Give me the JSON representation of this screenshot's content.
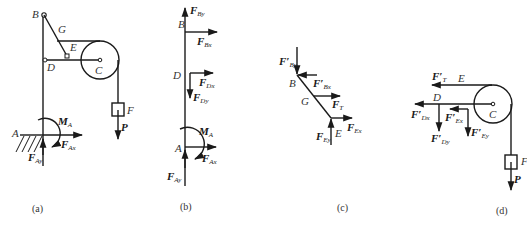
{
  "figure": {
    "colors": {
      "stroke": "#1a1a1a",
      "label": "#333333",
      "background": "#ffffff"
    },
    "panels": [
      {
        "id": "a",
        "caption": "(a)",
        "points": {
          "A": "A",
          "B": "B",
          "C": "C",
          "D": "D",
          "E": "E",
          "F": "F",
          "G": "G"
        },
        "forces": {
          "MA": {
            "main": "M",
            "sub": "A"
          },
          "FAx": {
            "main": "F",
            "sub": "Ax"
          },
          "FAy": {
            "main": "F",
            "sub": "Ay"
          },
          "P": {
            "main": "P",
            "sub": ""
          }
        }
      },
      {
        "id": "b",
        "caption": "(b)",
        "points": {
          "A": "A",
          "B": "B",
          "D": "D"
        },
        "forces": {
          "FBy": {
            "main": "F",
            "sub": "By"
          },
          "FBx": {
            "main": "F",
            "sub": "Bx"
          },
          "FDx": {
            "main": "F",
            "sub": "Dx"
          },
          "FDy": {
            "main": "F",
            "sub": "Dy"
          },
          "MA": {
            "main": "M",
            "sub": "A"
          },
          "FAx": {
            "main": "F",
            "sub": "Ax"
          },
          "FAy": {
            "main": "F",
            "sub": "Ay"
          }
        }
      },
      {
        "id": "c",
        "caption": "(c)",
        "points": {
          "B": "B",
          "G": "G",
          "E": "E"
        },
        "forces": {
          "FBy": {
            "main": "F′",
            "sub": "By"
          },
          "FBx": {
            "main": "F′",
            "sub": "Bx"
          },
          "FT": {
            "main": "F",
            "sub": "T"
          },
          "FEx": {
            "main": "F",
            "sub": "Ex"
          },
          "FEy": {
            "main": "F",
            "sub": "Ey"
          }
        }
      },
      {
        "id": "d",
        "caption": "(d)",
        "points": {
          "E": "E",
          "D": "D",
          "C": "C",
          "F": "F"
        },
        "forces": {
          "FT": {
            "main": "F′",
            "sub": "T"
          },
          "FDx": {
            "main": "F′",
            "sub": "Dx"
          },
          "FDy": {
            "main": "F′",
            "sub": "Dy"
          },
          "FEx": {
            "main": "F′",
            "sub": "Ex"
          },
          "FEy": {
            "main": "F′",
            "sub": "Ey"
          },
          "P": {
            "main": "P",
            "sub": ""
          }
        }
      }
    ]
  }
}
